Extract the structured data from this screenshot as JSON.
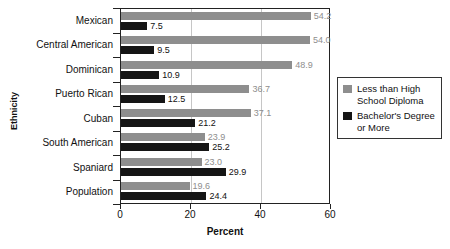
{
  "chart_data": {
    "type": "bar",
    "orientation": "horizontal",
    "title": "",
    "xlabel": "Percent",
    "ylabel": "Ethnicity",
    "xlim": [
      0,
      60
    ],
    "xticks": [
      0,
      20,
      40,
      60
    ],
    "xtick_labels": [
      "0",
      "20",
      "40",
      "60"
    ],
    "grid": "vertical",
    "legend_position": "right",
    "categories": [
      "Mexican",
      "Central American",
      "Dominican",
      "Puerto Rican",
      "Cuban",
      "South American",
      "Spaniard",
      "Population"
    ],
    "series": [
      {
        "name": "Less than High School Diploma",
        "color": "#8e8e8e",
        "values": [
          54.2,
          54.0,
          48.9,
          36.7,
          37.1,
          23.9,
          23.0,
          19.6
        ],
        "labels": [
          "54.2",
          "54.0",
          "48.9",
          "36.7",
          "37.1",
          "23.9",
          "23.0",
          "19.6"
        ]
      },
      {
        "name": "Bachelor's Degree or More",
        "color": "#151515",
        "values": [
          7.5,
          9.5,
          10.9,
          12.5,
          21.2,
          25.2,
          29.9,
          24.4
        ],
        "labels": [
          "7.5",
          "9.5",
          "10.9",
          "12.5",
          "21.2",
          "25.2",
          "29.9",
          "24.4"
        ]
      }
    ]
  },
  "legend": {
    "items": [
      {
        "label": "Less than High\nSchool Diploma",
        "color": "#8e8e8e"
      },
      {
        "label": "Bachelor's Degree\nor More",
        "color": "#151515"
      }
    ]
  }
}
